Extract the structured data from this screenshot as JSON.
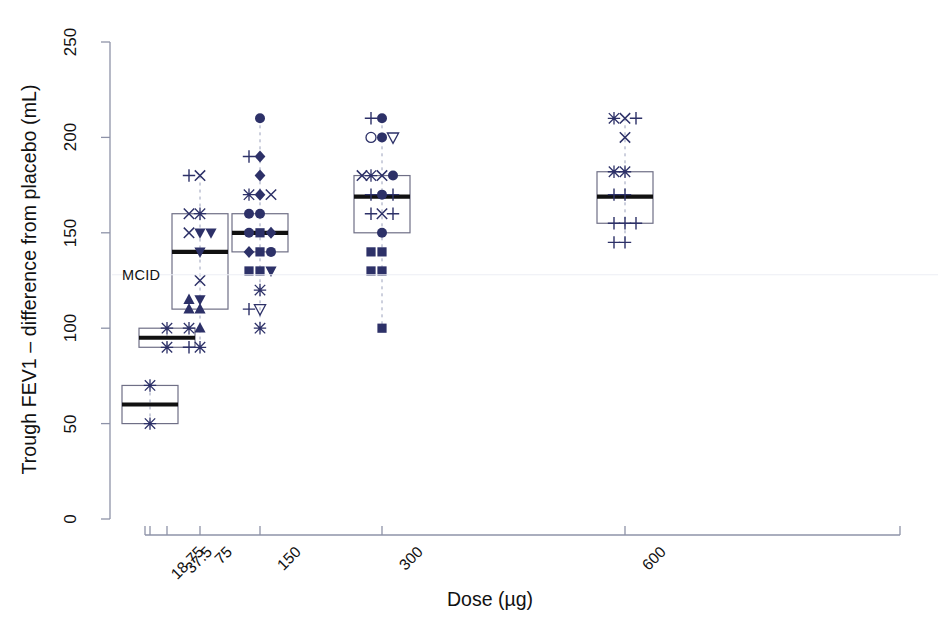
{
  "chart_data": {
    "type": "boxplot-scatter",
    "title": "",
    "xlabel": "Dose (µg)",
    "ylabel": "Trough FEV1 – difference from placebo (mL)",
    "ylim": [
      0,
      250
    ],
    "yticks": [
      0,
      50,
      100,
      150,
      200,
      250
    ],
    "ytick_labels": [
      "0",
      "50",
      "100",
      "150",
      "200",
      "250"
    ],
    "xtick_labels": [
      "18.75",
      "37.5",
      "75",
      "150",
      "300",
      "600"
    ],
    "x_categories": [
      18.75,
      37.5,
      75,
      150,
      300,
      600
    ],
    "x_scale": "log",
    "grid": false,
    "legend": null,
    "annotations": [
      {
        "text": "MCID",
        "value": 128,
        "note": "minimal clinically important difference label at left of plot"
      }
    ],
    "marker_color": "#2d3168",
    "box_line_color": "#6f6f86",
    "median_line_color": "#111111",
    "axis_color": "#8e93a8",
    "groups": [
      {
        "dose": "18.75",
        "box": {
          "q1": 50,
          "median": 60,
          "q3": 70,
          "whisker_low": 50,
          "whisker_high": 70
        },
        "points": [
          {
            "value": 70,
            "marker": "asterisk"
          },
          {
            "value": 50,
            "marker": "asterisk"
          }
        ]
      },
      {
        "dose": "37.5",
        "box": {
          "q1": 90,
          "median": 95,
          "q3": 100,
          "whisker_low": 90,
          "whisker_high": 100
        },
        "points": [
          {
            "value": 100,
            "marker": "asterisk"
          },
          {
            "value": 90,
            "marker": "asterisk"
          }
        ]
      },
      {
        "dose": "75",
        "box": {
          "q1": 110,
          "median": 140,
          "q3": 160,
          "whisker_low": 90,
          "whisker_high": 180
        },
        "points": [
          {
            "value": 180,
            "marker": "x"
          },
          {
            "value": 180,
            "marker": "plus"
          },
          {
            "value": 160,
            "marker": "asterisk"
          },
          {
            "value": 160,
            "marker": "x"
          },
          {
            "value": 150,
            "marker": "triangle-down"
          },
          {
            "value": 150,
            "marker": "x"
          },
          {
            "value": 150,
            "marker": "triangle-down"
          },
          {
            "value": 140,
            "marker": "triangle-down"
          },
          {
            "value": 125,
            "marker": "x"
          },
          {
            "value": 115,
            "marker": "triangle-down"
          },
          {
            "value": 115,
            "marker": "triangle-up"
          },
          {
            "value": 110,
            "marker": "triangle-up"
          },
          {
            "value": 110,
            "marker": "triangle-up"
          },
          {
            "value": 100,
            "marker": "triangle-up"
          },
          {
            "value": 100,
            "marker": "asterisk"
          },
          {
            "value": 90,
            "marker": "asterisk"
          },
          {
            "value": 90,
            "marker": "plus"
          }
        ]
      },
      {
        "dose": "150",
        "box": {
          "q1": 140,
          "median": 150,
          "q3": 160,
          "whisker_low": 130,
          "whisker_high": 170
        },
        "points": [
          {
            "value": 210,
            "marker": "circle"
          },
          {
            "value": 190,
            "marker": "diamond"
          },
          {
            "value": 190,
            "marker": "plus"
          },
          {
            "value": 180,
            "marker": "diamond"
          },
          {
            "value": 170,
            "marker": "diamond"
          },
          {
            "value": 170,
            "marker": "asterisk"
          },
          {
            "value": 170,
            "marker": "x"
          },
          {
            "value": 160,
            "marker": "circle"
          },
          {
            "value": 160,
            "marker": "circle"
          },
          {
            "value": 150,
            "marker": "square"
          },
          {
            "value": 150,
            "marker": "circle"
          },
          {
            "value": 150,
            "marker": "diamond"
          },
          {
            "value": 140,
            "marker": "square"
          },
          {
            "value": 140,
            "marker": "diamond"
          },
          {
            "value": 140,
            "marker": "circle"
          },
          {
            "value": 130,
            "marker": "square"
          },
          {
            "value": 130,
            "marker": "square"
          },
          {
            "value": 130,
            "marker": "triangle-down"
          },
          {
            "value": 120,
            "marker": "asterisk"
          },
          {
            "value": 110,
            "marker": "triangle-down-open"
          },
          {
            "value": 110,
            "marker": "plus"
          },
          {
            "value": 100,
            "marker": "asterisk"
          }
        ]
      },
      {
        "dose": "300",
        "box": {
          "q1": 150,
          "median": 169,
          "q3": 180,
          "whisker_low": 140,
          "whisker_high": 200
        },
        "points": [
          {
            "value": 210,
            "marker": "circle"
          },
          {
            "value": 210,
            "marker": "plus"
          },
          {
            "value": 200,
            "marker": "circle"
          },
          {
            "value": 200,
            "marker": "circle-open"
          },
          {
            "value": 200,
            "marker": "triangle-down-open"
          },
          {
            "value": 180,
            "marker": "x"
          },
          {
            "value": 180,
            "marker": "asterisk"
          },
          {
            "value": 180,
            "marker": "circle"
          },
          {
            "value": 180,
            "marker": "x"
          },
          {
            "value": 170,
            "marker": "circle"
          },
          {
            "value": 170,
            "marker": "plus"
          },
          {
            "value": 170,
            "marker": "plus"
          },
          {
            "value": 160,
            "marker": "x"
          },
          {
            "value": 160,
            "marker": "plus"
          },
          {
            "value": 160,
            "marker": "plus"
          },
          {
            "value": 150,
            "marker": "circle"
          },
          {
            "value": 140,
            "marker": "square"
          },
          {
            "value": 140,
            "marker": "square"
          },
          {
            "value": 130,
            "marker": "square"
          },
          {
            "value": 130,
            "marker": "square"
          },
          {
            "value": 100,
            "marker": "square"
          }
        ]
      },
      {
        "dose": "600",
        "box": {
          "q1": 155,
          "median": 169,
          "q3": 182,
          "whisker_low": 145,
          "whisker_high": 210
        },
        "points": [
          {
            "value": 210,
            "marker": "x"
          },
          {
            "value": 210,
            "marker": "asterisk"
          },
          {
            "value": 210,
            "marker": "plus"
          },
          {
            "value": 200,
            "marker": "x"
          },
          {
            "value": 182,
            "marker": "asterisk"
          },
          {
            "value": 182,
            "marker": "asterisk"
          },
          {
            "value": 170,
            "marker": "plus"
          },
          {
            "value": 170,
            "marker": "plus"
          },
          {
            "value": 155,
            "marker": "plus"
          },
          {
            "value": 155,
            "marker": "plus"
          },
          {
            "value": 155,
            "marker": "plus"
          },
          {
            "value": 145,
            "marker": "plus"
          },
          {
            "value": 145,
            "marker": "plus"
          }
        ]
      }
    ]
  }
}
